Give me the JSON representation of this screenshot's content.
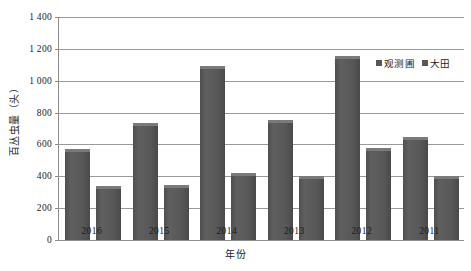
{
  "chart_data": {
    "type": "bar",
    "title": "",
    "xlabel": "年份",
    "ylabel": "百丛虫量（头）",
    "categories": [
      "2016",
      "2015",
      "2014",
      "2013",
      "2012",
      "2011"
    ],
    "series": [
      {
        "name": "观测圃",
        "values": [
          570,
          735,
          1090,
          755,
          1155,
          645
        ],
        "color": "#585858"
      },
      {
        "name": "大田",
        "values": [
          340,
          345,
          420,
          400,
          575,
          405
        ],
        "color": "#585858"
      }
    ],
    "ylim": [
      0,
      1400
    ],
    "yticks": [
      0,
      200,
      400,
      600,
      800,
      1000,
      1200,
      1400
    ],
    "ytick_labels": [
      "0",
      "200",
      "400",
      "600",
      "800",
      "1 000",
      "1 200",
      "1 400"
    ],
    "grid": true,
    "legend_position": "top-right"
  },
  "legend": {
    "entries": [
      {
        "label": "观测圃",
        "swatch": "legend-swatch-icon"
      },
      {
        "label": "大田",
        "swatch": "legend-swatch-icon"
      }
    ]
  }
}
